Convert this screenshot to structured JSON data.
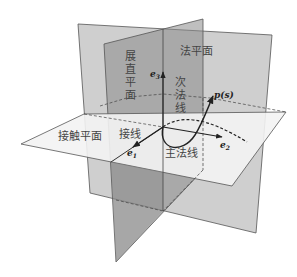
{
  "diagram": {
    "title": "",
    "planes": {
      "rectifying": {
        "label_chars": [
          "展",
          "直",
          "平",
          "面"
        ],
        "label": "展直平面"
      },
      "normal": {
        "label": "法平面"
      },
      "osculating": {
        "label": "接触平面"
      }
    },
    "lines": {
      "binormal": {
        "label_chars": [
          "次",
          "法",
          "线"
        ],
        "label": "次法线"
      },
      "tangent": {
        "label": "接线"
      },
      "principal_normal": {
        "label": "主法线"
      }
    },
    "vectors": {
      "e1": {
        "base": "e",
        "sub": "1"
      },
      "e2": {
        "base": "e",
        "sub": "2"
      },
      "e3": {
        "base": "e",
        "sub": "3"
      }
    },
    "curve": {
      "label": "p(s)"
    },
    "colors": {
      "plane_dark": "#8c8c8c",
      "plane_light": "#b5b5b5",
      "osculating": "#f2f2f2",
      "edge": "#555555",
      "curve": "#2a2a2a"
    }
  }
}
